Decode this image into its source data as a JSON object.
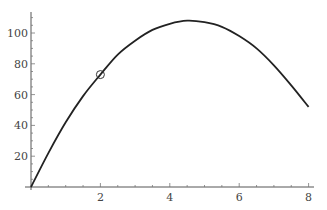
{
  "chart_data": {
    "type": "line",
    "title": "",
    "xlabel": "",
    "ylabel": "",
    "xlim": [
      0,
      8
    ],
    "ylim": [
      0,
      110
    ],
    "grid": false,
    "x_ticks": [
      "2",
      "4",
      "6",
      "8"
    ],
    "y_ticks": [
      "20",
      "40",
      "60",
      "80",
      "100"
    ],
    "series": [
      {
        "name": "curve",
        "x": [
          0,
          0.5,
          1,
          1.5,
          2,
          2.5,
          3,
          3.5,
          4,
          4.5,
          5,
          5.5,
          6,
          6.5,
          7,
          7.5,
          8
        ],
        "values": [
          0,
          22,
          42,
          59,
          73,
          86,
          95,
          102,
          106,
          108,
          107,
          104,
          98,
          90,
          79,
          66,
          52
        ]
      }
    ],
    "annotations": [
      {
        "type": "circle-marker",
        "x": 2,
        "y": 73
      }
    ]
  }
}
